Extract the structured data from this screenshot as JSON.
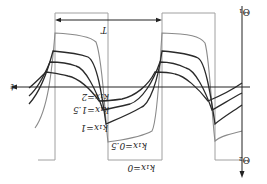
{
  "diagram": {
    "orientation": "rotated 180 degrees",
    "axes": {
      "vertical_top_label": "Θ₁",
      "vertical_bottom_label": "Θ₂",
      "horizontal_label": "t"
    },
    "period_label": "T",
    "curves": [
      {
        "label": "k₁x=0",
        "color": "#9a9a9a"
      },
      {
        "label": "k₁x=0.5",
        "color": "#8a8a8a"
      },
      {
        "label": "k₁x=1",
        "color": "#2a2a2a"
      },
      {
        "label": "k₁x=1.5",
        "color": "#2a2a2a"
      },
      {
        "label": "k₁x=2",
        "color": "#2a2a2a"
      }
    ]
  }
}
